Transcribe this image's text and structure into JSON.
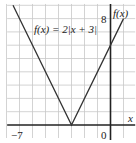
{
  "chart_data": {
    "type": "line",
    "title": "",
    "function_label": "f(x) = 2|x + 3|",
    "xlabel": "x",
    "ylabel": "f(x)",
    "tick_labels": {
      "x_min_label": "−7",
      "origin_label": "0",
      "y_max_label": "8"
    },
    "xlim": [
      -8,
      1.5
    ],
    "ylim": [
      -1,
      9
    ],
    "grid": true,
    "series": [
      {
        "name": "f(x) = 2|x + 3|",
        "x": [
          -7.5,
          -3,
          1
        ],
        "y": [
          9,
          0,
          8
        ]
      }
    ],
    "colors": {
      "grid": "#c8c8c8",
      "axis": "#222222",
      "curve": "#333333"
    }
  }
}
